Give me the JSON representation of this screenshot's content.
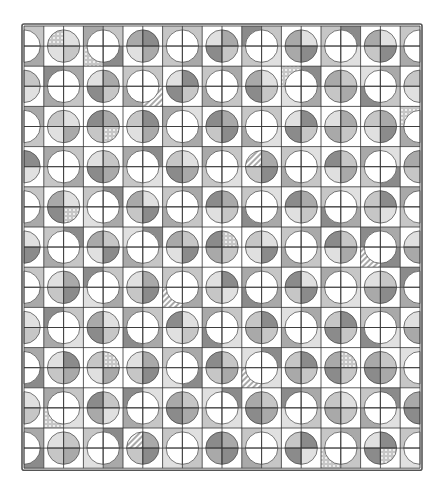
{
  "quilt": {
    "x": 24,
    "y": 26,
    "cell_w": 19.8,
    "cell_h": 20.1,
    "cols": 20,
    "rows": 22,
    "border_color": "#555555",
    "line_color": "#333333",
    "background": "#ffffff",
    "shades": {
      "1": "#e0e0e0",
      "2": "#c6c6c6",
      "3": "#a9a9a9",
      "4": "#8b8b8b"
    },
    "cell_types_legend": {
      "S": "shaded quarter-disc in corner on white ground",
      "W": "white quarter-disc in corner on shaded ground"
    },
    "types": [
      "WSSWWSSWWSSWWSSWWSSW",
      "WSSWWSSWWSSWWSSWWSSW",
      "SWWSSWWSSWWSSWWSSWWS",
      "SWWSSWWSSWWSSWWSSWWS",
      "WSSSSSSWWSSWWSSSSSSW",
      "WSSSSSSWWSSWWSSSSSSW",
      "SWWSSWWSSWWSSWWSSWWS",
      "SWWSSWWSSWWSSWWSSWWS",
      "WSSWWSSWWSSWWSSWWSSW",
      "WSSWWSSWWSSWWSSWWSSW",
      "SWWSSWWSSSSSSWWSSWWS",
      "SWWSSWWSSSSSSWWSSWWS",
      "WSSWWSSWWSSWWSSWWSSW",
      "WSSWWSSWWSSWWSSWWSSW",
      "SWWSSWWSSWWSSWWSSWWS",
      "SWWSSWWSSWWSSWWSSWWS",
      "WSSSSSSWWSSWWSSSSSSW",
      "WSSSSSSWWSSWWSSSSSSW",
      "SWWSSWWSSWWSSWWSSWWS",
      "SWWSSWWSSWWSSWWSSWWS",
      "WSSWWSSWWSSWWSSWWSSW",
      "WSSWWSSWWSSWWSSWWSSW"
    ],
    "shade_map": [
      "22132342213423124312",
      "31224132342213421243",
      "24313221423312432132",
      "13242314232421323421",
      "32143243143221413232",
      "21324132324314232143",
      "43212342132432142313",
      "12343214321243213242",
      "23124312343214321243",
      "34213243212431243212",
      "12432143243212342431",
      "43214321432143213243",
      "21342132214324132124",
      "32413243321432421343",
      "14231324132241324231",
      "23142431241323142413",
      "31424132342142431321",
      "42313241423213242432",
      "13242413214324321243",
      "24131324321431232314",
      "31224132143212423142",
      "42313241234324132421"
    ],
    "patterned_cells": [
      {
        "r": 0,
        "c": 1,
        "pattern": "dots"
      },
      {
        "r": 1,
        "c": 3,
        "pattern": "dots"
      },
      {
        "r": 3,
        "c": 6,
        "pattern": "stripes"
      },
      {
        "r": 2,
        "c": 13,
        "pattern": "dots"
      },
      {
        "r": 4,
        "c": 19,
        "pattern": "dots"
      },
      {
        "r": 5,
        "c": 4,
        "pattern": "dots"
      },
      {
        "r": 6,
        "c": 11,
        "pattern": "stripes"
      },
      {
        "r": 9,
        "c": 2,
        "pattern": "dots"
      },
      {
        "r": 10,
        "c": 10,
        "pattern": "dots"
      },
      {
        "r": 11,
        "c": 17,
        "pattern": "stripes"
      },
      {
        "r": 13,
        "c": 7,
        "pattern": "stripes"
      },
      {
        "r": 16,
        "c": 4,
        "pattern": "dots"
      },
      {
        "r": 17,
        "c": 11,
        "pattern": "stripes"
      },
      {
        "r": 16,
        "c": 16,
        "pattern": "dots"
      },
      {
        "r": 19,
        "c": 1,
        "pattern": "dots"
      },
      {
        "r": 21,
        "c": 15,
        "pattern": "dots"
      },
      {
        "r": 21,
        "c": 18,
        "pattern": "dots"
      },
      {
        "r": 20,
        "c": 5,
        "pattern": "stripes"
      }
    ],
    "full_circles": [
      {
        "col_line": 4,
        "row_line": 5
      },
      {
        "col_line": 10,
        "row_line": 5
      },
      {
        "col_line": 16,
        "row_line": 5
      },
      {
        "col_line": 4,
        "row_line": 11
      },
      {
        "col_line": 10,
        "row_line": 11
      },
      {
        "col_line": 16,
        "row_line": 11
      },
      {
        "col_line": 4,
        "row_line": 17
      },
      {
        "col_line": 10,
        "row_line": 17
      },
      {
        "col_line": 16,
        "row_line": 17
      }
    ]
  }
}
